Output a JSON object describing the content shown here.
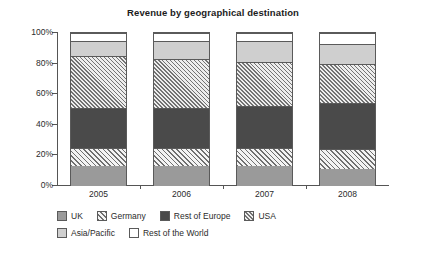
{
  "chart_data": {
    "type": "bar",
    "subtype": "stacked-100-percent",
    "title": "Revenue by geographical destination",
    "xlabel": "",
    "ylabel": "",
    "categories": [
      "2005",
      "2006",
      "2007",
      "2008"
    ],
    "ylim": [
      0,
      100
    ],
    "ytick_labels": [
      "0%",
      "20%",
      "40%",
      "60%",
      "80%",
      "100%"
    ],
    "ytick_values": [
      0,
      20,
      40,
      60,
      80,
      100
    ],
    "grid": false,
    "legend_position": "bottom-left",
    "series": [
      {
        "name": "UK",
        "fill": "solid-medium-gray",
        "color": "#9a9a9a",
        "values": [
          13,
          13,
          13,
          11
        ]
      },
      {
        "name": "Germany",
        "fill": "diagonal-hatch-wide",
        "color": "#f3f3f3",
        "values": [
          12,
          12,
          12,
          13
        ]
      },
      {
        "name": "Rest of Europe",
        "fill": "solid-dark-gray",
        "color": "#4a4a4a",
        "values": [
          26,
          26,
          27,
          30
        ]
      },
      {
        "name": "USA",
        "fill": "diagonal-hatch-fine",
        "color": "#ededed",
        "values": [
          34,
          32,
          29,
          26
        ]
      },
      {
        "name": "Asia/Pacific",
        "fill": "solid-light-gray",
        "color": "#cfcfcf",
        "values": [
          10,
          12,
          14,
          13
        ]
      },
      {
        "name": "Rest of the World",
        "fill": "white",
        "color": "#ffffff",
        "values": [
          5,
          5,
          5,
          7
        ]
      }
    ]
  },
  "legend": {
    "row1": [
      "UK",
      "Germany",
      "Rest of Europe",
      "USA"
    ],
    "row2": [
      "Asia/Pacific",
      "Rest of the World"
    ]
  }
}
